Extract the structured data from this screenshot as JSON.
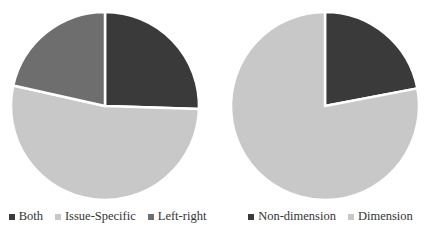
{
  "chart_data": [
    {
      "type": "pie",
      "title": "",
      "categories": [
        "Both",
        "Issue-Specific",
        "Left-right"
      ],
      "values": [
        25.5,
        53.0,
        21.5
      ],
      "colors": [
        "#3a3a3a",
        "#c8c8c8",
        "#6e6e6e"
      ],
      "start_angle": 0,
      "direction": "clockwise",
      "legend_position": "bottom"
    },
    {
      "type": "pie",
      "title": "",
      "categories": [
        "Non-dimension",
        "Dimension"
      ],
      "values": [
        22.0,
        78.0
      ],
      "colors": [
        "#3a3a3a",
        "#c8c8c8"
      ],
      "start_angle": 0,
      "direction": "clockwise",
      "legend_position": "bottom"
    }
  ],
  "legends": {
    "left": [
      "Both",
      "Issue-Specific",
      "Left-right"
    ],
    "right": [
      "Non-dimension",
      "Dimension"
    ]
  }
}
